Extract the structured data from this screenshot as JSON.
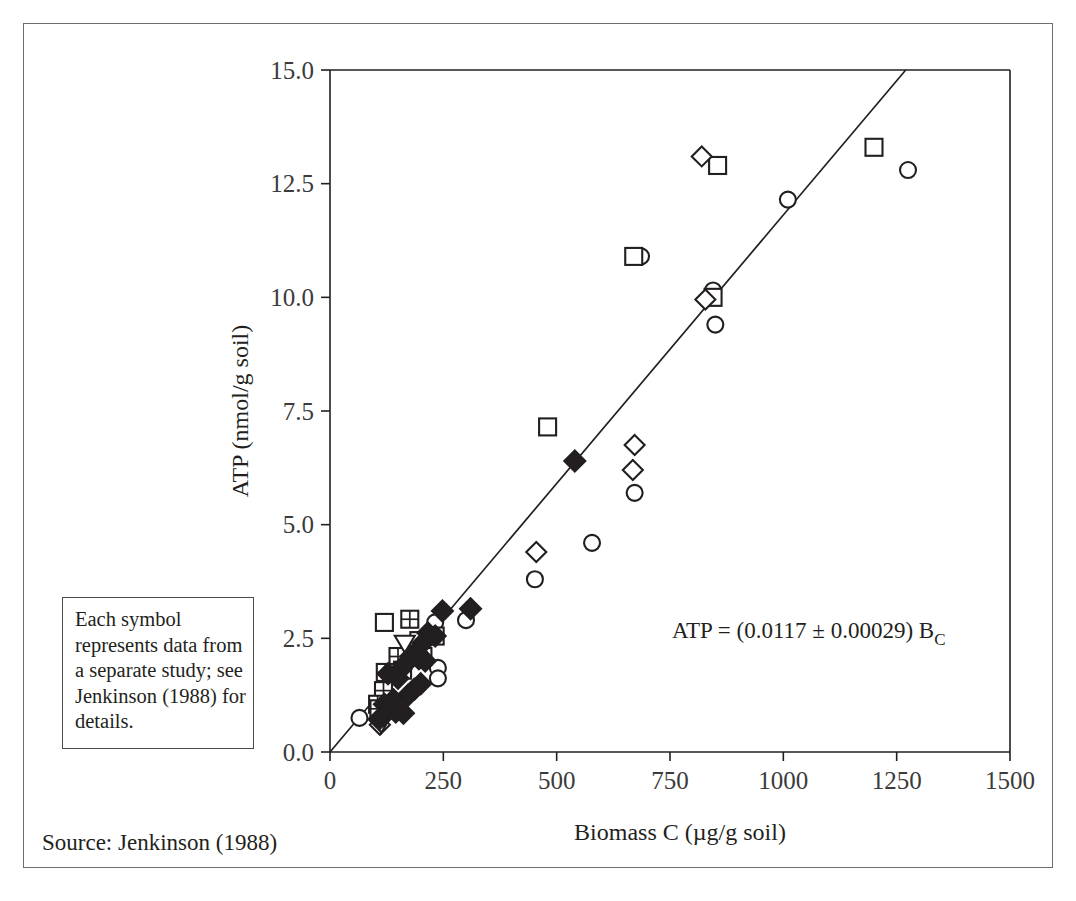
{
  "figure": {
    "source_note": "Source: Jenkinson (1988)",
    "note_box": "Each symbol represents data from a separate study; see Jenkinson (1988) for details.",
    "equation": "ATP = (0.0117 ± 0.00029) B",
    "equation_subscript": "C"
  },
  "chart_data": {
    "type": "scatter",
    "title": "",
    "xlabel": "Biomass C (µg/g soil)",
    "ylabel": "ATP (nmol/g soil)",
    "xlim": [
      0,
      1500
    ],
    "ylim": [
      0,
      15
    ],
    "xticks": [
      0,
      250,
      500,
      750,
      1000,
      1250,
      1500
    ],
    "xtick_labels": [
      "0",
      "250",
      "500",
      "750",
      "1000",
      "1250",
      "1500"
    ],
    "yticks": [
      0.0,
      2.5,
      5.0,
      7.5,
      10.0,
      12.5,
      15.0
    ],
    "ytick_labels": [
      "0.0",
      "2.5",
      "5.0",
      "7.5",
      "10.0",
      "12.5",
      "15.0"
    ],
    "grid": false,
    "legend": "none",
    "fit_line": {
      "slope": 0.0117,
      "slope_error": 0.00029,
      "intercept": 0,
      "x_start": 0,
      "x_end": 1270,
      "y_start": 0,
      "y_end": 15.0
    },
    "series": [
      {
        "name": "open-circle",
        "marker": "circle-open",
        "points": [
          [
            65,
            0.75
          ],
          [
            232,
            2.85
          ],
          [
            238,
            1.85
          ],
          [
            238,
            1.62
          ],
          [
            300,
            2.9
          ],
          [
            452,
            3.8
          ],
          [
            578,
            4.6
          ],
          [
            672,
            5.7
          ],
          [
            686,
            10.9
          ],
          [
            845,
            10.15
          ],
          [
            850,
            9.4
          ],
          [
            1010,
            12.15
          ],
          [
            1275,
            12.8
          ]
        ]
      },
      {
        "name": "open-square",
        "marker": "square-open",
        "points": [
          [
            120,
            2.85
          ],
          [
            196,
            2.45
          ],
          [
            205,
            2.1
          ],
          [
            160,
            1.85
          ],
          [
            232,
            2.55
          ],
          [
            480,
            7.15
          ],
          [
            670,
            10.9
          ],
          [
            845,
            10.0
          ],
          [
            855,
            12.9
          ],
          [
            1200,
            13.3
          ]
        ]
      },
      {
        "name": "crossed-square",
        "marker": "square-crossed",
        "points": [
          [
            176,
            2.92
          ],
          [
            150,
            2.1
          ],
          [
            160,
            1.8
          ],
          [
            122,
            1.75
          ],
          [
            118,
            1.35
          ],
          [
            105,
            1.05
          ],
          [
            108,
            0.95
          ]
        ]
      },
      {
        "name": "open-diamond",
        "marker": "diamond-open",
        "points": [
          [
            455,
            4.4
          ],
          [
            672,
            6.75
          ],
          [
            668,
            6.2
          ],
          [
            828,
            9.95
          ],
          [
            820,
            13.1
          ],
          [
            110,
            0.6
          ]
        ]
      },
      {
        "name": "open-triangle-down",
        "marker": "triangle-down-open",
        "points": [
          [
            165,
            2.38
          ],
          [
            113,
            0.62
          ]
        ]
      },
      {
        "name": "filled-diamond",
        "marker": "diamond-filled",
        "points": [
          [
            248,
            3.1
          ],
          [
            216,
            2.62
          ],
          [
            232,
            2.55
          ],
          [
            205,
            2.4
          ],
          [
            190,
            2.2
          ],
          [
            178,
            2.1
          ],
          [
            196,
            2.05
          ],
          [
            210,
            2.0
          ],
          [
            168,
            1.95
          ],
          [
            156,
            1.82
          ],
          [
            128,
            1.72
          ],
          [
            150,
            1.62
          ],
          [
            200,
            1.5
          ],
          [
            186,
            1.38
          ],
          [
            172,
            1.25
          ],
          [
            140,
            1.15
          ],
          [
            120,
            1.05
          ],
          [
            132,
            0.98
          ],
          [
            145,
            0.88
          ],
          [
            118,
            0.8
          ],
          [
            108,
            0.72
          ],
          [
            162,
            0.85
          ],
          [
            310,
            3.15
          ],
          [
            540,
            6.4
          ]
        ]
      }
    ]
  }
}
